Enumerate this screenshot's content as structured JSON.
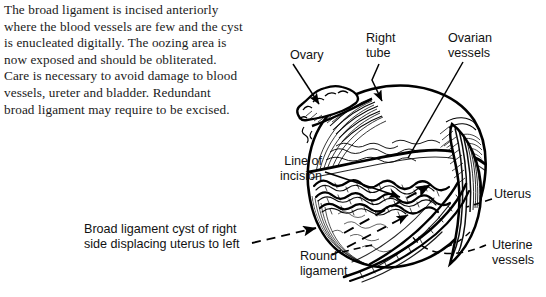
{
  "document": {
    "body_text": "The broad ligament is incised anteriorly\nwhere the blood vessels are few and the cyst\nis enucleated digitally. The oozing area is\nnow exposed and should be obliterated.\nCare is necessary to avoid damage to blood\nvessels, ureter and bladder. Redundant\nbroad ligament may require to be excised."
  },
  "figure": {
    "subject": "broad ligament cyst of right side displacing uterus to left",
    "style": "black-and-white line engraving",
    "ink_color": "#000000",
    "background_color": "#ffffff",
    "labels": {
      "ovary": "Ovary",
      "right_tube": "Right\ntube",
      "ovarian_vessels": "Ovarian\nvessels",
      "line_of_incision": "Line of\nincision",
      "uterus": "Uterus",
      "uterine_vessels": "Uterine\nvessels",
      "round_ligament": "Round\nligament",
      "caption": "Broad ligament cyst of right\nside displacing uterus to left"
    },
    "leaders": [
      {
        "name": "ovary-leader",
        "style": "solid",
        "arrowhead": true
      },
      {
        "name": "right-tube-leader",
        "style": "solid",
        "arrowhead": true
      },
      {
        "name": "ovarian-vessels-leader",
        "style": "solid",
        "arrowhead": false
      },
      {
        "name": "line-of-incision-leader",
        "style": "solid",
        "arrowhead": true
      },
      {
        "name": "incision-direction-arrow",
        "style": "dashed",
        "arrowhead": true
      },
      {
        "name": "caption-leader",
        "style": "dashed",
        "arrowhead": true
      },
      {
        "name": "round-ligament-leader",
        "style": "dashed",
        "arrowhead": false
      },
      {
        "name": "uterus-leader",
        "style": "dashed",
        "arrowhead": false
      },
      {
        "name": "uterine-vessels-leader",
        "style": "dashed",
        "arrowhead": false
      }
    ]
  }
}
